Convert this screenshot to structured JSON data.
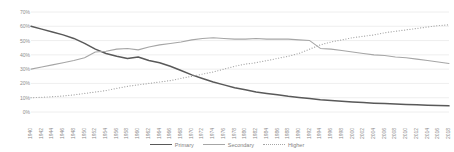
{
  "chart_data": {
    "type": "line",
    "title": "",
    "xlabel": "",
    "ylabel": "",
    "ylim": [
      0,
      70
    ],
    "grid": true,
    "legend_position": "bottom",
    "y_ticks": [
      "0%",
      "10%",
      "20%",
      "30%",
      "40%",
      "50%",
      "60%",
      "70%"
    ],
    "y_tick_values": [
      0,
      10,
      20,
      30,
      40,
      50,
      60,
      70
    ],
    "categories": [
      "1940",
      "1942",
      "1944",
      "1946",
      "1948",
      "1950",
      "1952",
      "1954",
      "1956",
      "1958",
      "1960",
      "1962",
      "1964",
      "1966",
      "1968",
      "1970",
      "1972",
      "1974",
      "1976",
      "1978",
      "1980",
      "1982",
      "1984",
      "1986",
      "1988",
      "1990",
      "1992",
      "1994",
      "1996",
      "1998",
      "2000",
      "2002",
      "2004",
      "2006",
      "2008",
      "2010",
      "2012",
      "2014",
      "2016",
      "2018"
    ],
    "series": [
      {
        "name": "Primary",
        "style": "solid",
        "color": "#595959",
        "values": [
          60.0,
          58.0,
          56.0,
          54.0,
          51.5,
          48.0,
          44.0,
          41.0,
          39.0,
          37.5,
          38.5,
          36.0,
          34.5,
          32.0,
          29.0,
          26.0,
          23.5,
          21.0,
          19.0,
          17.0,
          15.5,
          14.0,
          13.0,
          12.0,
          11.0,
          10.2,
          9.5,
          8.6,
          8.0,
          7.5,
          7.0,
          6.6,
          6.2,
          5.9,
          5.6,
          5.3,
          5.0,
          4.8,
          4.5,
          4.3
        ]
      },
      {
        "name": "Secondary",
        "style": "solid",
        "color": "#a6a6a6",
        "values": [
          30.0,
          31.5,
          33.0,
          34.5,
          36.0,
          38.0,
          42.0,
          42.5,
          44.0,
          44.5,
          43.5,
          45.5,
          47.0,
          48.0,
          49.0,
          50.5,
          51.5,
          52.0,
          51.5,
          51.0,
          51.0,
          51.5,
          51.0,
          51.0,
          51.0,
          50.5,
          50.0,
          44.5,
          44.0,
          43.0,
          42.0,
          41.0,
          40.0,
          39.5,
          38.5,
          38.0,
          37.0,
          36.0,
          35.0,
          34.0
        ]
      },
      {
        "name": "Higher",
        "style": "dotted",
        "color": "#a6a6a6",
        "values": [
          10.0,
          10.3,
          10.7,
          11.2,
          12.0,
          13.0,
          14.0,
          15.0,
          16.5,
          18.0,
          19.0,
          20.0,
          21.0,
          22.0,
          23.5,
          25.0,
          26.5,
          28.0,
          30.0,
          32.0,
          33.5,
          34.5,
          36.0,
          37.5,
          39.0,
          41.0,
          44.0,
          47.0,
          49.0,
          50.5,
          52.0,
          53.0,
          54.0,
          55.5,
          56.5,
          57.5,
          58.5,
          59.5,
          60.5,
          61.0
        ]
      }
    ]
  },
  "legend": {
    "items": [
      {
        "label": "Primary",
        "key": "line-solid-dark"
      },
      {
        "label": "Secondary",
        "key": "line-solid-gray"
      },
      {
        "label": "Higher",
        "key": "line-dotted-gray"
      }
    ]
  },
  "colors": {
    "primary": "#595959",
    "secondary": "#a6a6a6",
    "higher": "#a6a6a6",
    "gridline": "#eaeaea",
    "axis_text": "#8d8d8d",
    "background": "#ffffff"
  }
}
